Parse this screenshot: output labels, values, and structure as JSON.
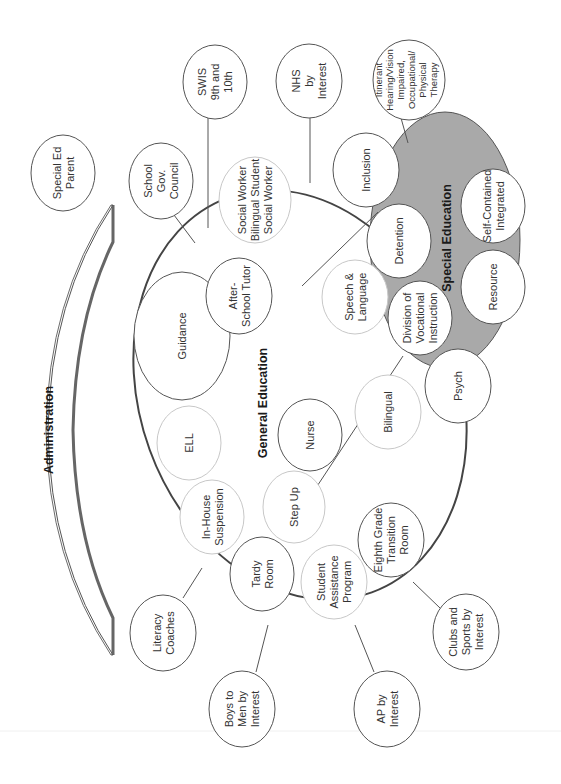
{
  "diagram": {
    "colors": {
      "special_ed_fill": "#a9a9a9",
      "outline": "#555555",
      "light_outline": "#c8c8c8",
      "admin_shadow": "#666666"
    },
    "administration": {
      "label": "Administration"
    },
    "general_education": {
      "label": "General Education"
    },
    "special_education": {
      "label": "Special Education"
    },
    "outer_nodes": [
      {
        "id": "special-ed-parent",
        "lines": [
          "Special Ed",
          "Parent"
        ]
      },
      {
        "id": "school-gov-council",
        "lines": [
          "School",
          "Gov.",
          "Council"
        ]
      },
      {
        "id": "swis",
        "lines": [
          "SWIS",
          "9th and",
          "10th"
        ]
      },
      {
        "id": "nhs",
        "lines": [
          "NHS",
          "by",
          "Interest"
        ]
      },
      {
        "id": "itinerant",
        "lines": [
          "Itinerant",
          "Hearing/Vision",
          "Impaired,",
          "Occupational/",
          "Physical",
          "Therapy"
        ]
      },
      {
        "id": "literacy-coaches",
        "lines": [
          "Literacy",
          "Coaches"
        ]
      },
      {
        "id": "boys-to-men",
        "lines": [
          "Boys to",
          "Men by",
          "Interest"
        ]
      },
      {
        "id": "ap-by-interest",
        "lines": [
          "AP by",
          "Interest"
        ]
      },
      {
        "id": "clubs-sports",
        "lines": [
          "Clubs and",
          "Sports by",
          "Interest"
        ]
      }
    ],
    "general_nodes": [
      {
        "id": "guidance",
        "lines": [
          "Guidance"
        ]
      },
      {
        "id": "after-school-tutor",
        "lines": [
          "After-",
          "School Tutor"
        ]
      },
      {
        "id": "social-worker",
        "lines": [
          "Social Worker",
          "Bilingual Student",
          "Social Worker"
        ]
      },
      {
        "id": "inclusion",
        "lines": [
          "Inclusion"
        ]
      },
      {
        "id": "speech-language",
        "lines": [
          "Speech &",
          "Language"
        ]
      },
      {
        "id": "ell",
        "lines": [
          "ELL"
        ]
      },
      {
        "id": "nurse",
        "lines": [
          "Nurse"
        ]
      },
      {
        "id": "bilingual",
        "lines": [
          "Bilingual"
        ]
      },
      {
        "id": "psych",
        "lines": [
          "Psych"
        ]
      },
      {
        "id": "in-house-suspension",
        "lines": [
          "In-House",
          "Suspension"
        ]
      },
      {
        "id": "step-up",
        "lines": [
          "Step Up"
        ]
      },
      {
        "id": "tardy-room",
        "lines": [
          "Tardy",
          "Room"
        ]
      },
      {
        "id": "student-assistance",
        "lines": [
          "Student",
          "Assistance",
          "Program"
        ]
      },
      {
        "id": "eighth-grade",
        "lines": [
          "Eighth Grade",
          "Transition",
          "Room"
        ]
      }
    ],
    "special_nodes": [
      {
        "id": "detention",
        "lines": [
          "Detention"
        ]
      },
      {
        "id": "division-vocational",
        "lines": [
          "Division of",
          "Vocational",
          "Instruction"
        ]
      },
      {
        "id": "self-contained",
        "lines": [
          "Self-Contained",
          "Integrated"
        ]
      },
      {
        "id": "resource",
        "lines": [
          "Resource"
        ]
      }
    ]
  }
}
